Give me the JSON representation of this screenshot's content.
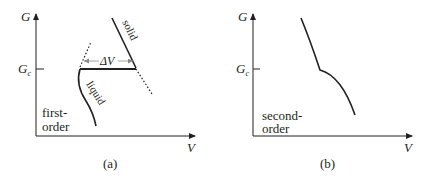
{
  "panels": [
    {
      "id": "a",
      "caption": "(a)",
      "y_axis_label": "G",
      "critical_label_main": "G",
      "critical_label_sub": "c",
      "x_axis_label": "V",
      "type_label_line1": "first-",
      "type_label_line2": "order",
      "curve_labels": {
        "solid": "solid",
        "liquid": "liquid"
      },
      "gap_label": "ΔV"
    },
    {
      "id": "b",
      "caption": "(b)",
      "y_axis_label": "G",
      "critical_label_main": "G",
      "critical_label_sub": "c",
      "x_axis_label": "V",
      "type_label_line1": "second-",
      "type_label_line2": "order"
    }
  ],
  "colors": {
    "ink": "#231f20",
    "arrow_gray": "#8a8a8a",
    "background": "#ffffff"
  }
}
